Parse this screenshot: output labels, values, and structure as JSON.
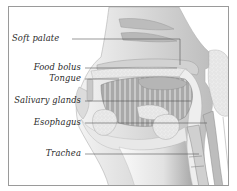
{
  "diagram": {
    "labels": [
      {
        "id": "soft-palate",
        "text": "Soft palate"
      },
      {
        "id": "food-bolus",
        "text": "Food bolus"
      },
      {
        "id": "tongue",
        "text": "Tongue"
      },
      {
        "id": "salivary-glands",
        "text": "Salivary glands"
      },
      {
        "id": "esophagus",
        "text": "Esophagus"
      },
      {
        "id": "trachea",
        "text": "Trachea"
      }
    ],
    "colors": {
      "frame": "#9a9a9a",
      "tissue_light": "#e6e6e6",
      "tissue_mid": "#c4c4c4",
      "tissue_dark": "#8d8d8d",
      "leader_line": "#555555",
      "label_text": "#2a2a2a"
    }
  }
}
